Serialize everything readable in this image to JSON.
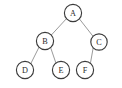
{
  "figure": {
    "background_color": "#ffffff",
    "node_fill": "#ffffff",
    "node_stroke": "#3b3b3b",
    "edge_color": "#8e8e8e",
    "label_color": "#2b2b2b"
  },
  "tree": {
    "nodes": [
      {
        "id": "A",
        "label": "A",
        "cx": 73,
        "cy": 13,
        "r": 8.6
      },
      {
        "id": "B",
        "label": "B",
        "cx": 45,
        "cy": 41,
        "r": 8.6
      },
      {
        "id": "C",
        "label": "C",
        "cx": 99,
        "cy": 42,
        "r": 8.2
      },
      {
        "id": "D",
        "label": "D",
        "cx": 25,
        "cy": 70,
        "r": 8.6
      },
      {
        "id": "E",
        "label": "E",
        "cx": 61,
        "cy": 70,
        "r": 8.6
      },
      {
        "id": "F",
        "label": "F",
        "cx": 85,
        "cy": 70,
        "r": 8.6
      }
    ],
    "edges": [
      {
        "from": "A",
        "to": "B",
        "x1": 66.5,
        "y1": 18.6,
        "x2": 51.0,
        "y2": 35.4
      },
      {
        "from": "A",
        "to": "C",
        "x1": 79.4,
        "y1": 18.9,
        "x2": 93.1,
        "y2": 36.4
      },
      {
        "from": "B",
        "to": "D",
        "x1": 39.0,
        "y1": 47.2,
        "x2": 30.6,
        "y2": 64.0
      },
      {
        "from": "B",
        "to": "E",
        "x1": 50.6,
        "y1": 47.5,
        "x2": 56.2,
        "y2": 63.9
      },
      {
        "from": "C",
        "to": "F",
        "x1": 93.2,
        "y1": 47.8,
        "x2": 90.3,
        "y2": 63.9
      }
    ]
  }
}
